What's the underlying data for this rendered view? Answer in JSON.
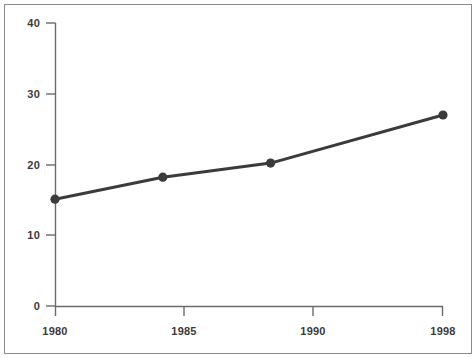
{
  "chart_data": {
    "type": "line",
    "title": "",
    "subtitle": "",
    "xlabel": "",
    "ylabel": "",
    "categories": [
      "1980",
      "1985",
      "1990",
      "1998"
    ],
    "x": [
      1980,
      1985,
      1990,
      1998
    ],
    "values": [
      15.1,
      18.2,
      20.2,
      27.0
    ],
    "series": [
      {
        "name": "series-1",
        "values": [
          15.1,
          18.2,
          20.2,
          27.0
        ],
        "color": "#3b3b3b",
        "marker": "circle",
        "line_width": 3
      }
    ],
    "xlim": [
      1980,
      1998
    ],
    "ylim": [
      0,
      40
    ],
    "ytick_values": [
      0,
      10,
      20,
      30,
      40
    ],
    "ytick_labels": [
      "0",
      "10",
      "20",
      "30",
      "40"
    ],
    "xtick_values": [
      1980,
      1985,
      1990,
      1998
    ],
    "xtick_labels": [
      "1980",
      "1985",
      "1990",
      "1998"
    ],
    "grid": false,
    "legend": false,
    "legend_position": "none",
    "annotations": []
  },
  "style": {
    "background_color": "#ffffff",
    "axis_color": "#6b6b6b",
    "border_color": "#8a8a8a",
    "line_color": "#3b3b3b",
    "marker_color": "#3b3b3b",
    "tick_label_color": "#3b3b3b"
  }
}
